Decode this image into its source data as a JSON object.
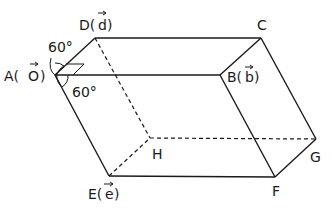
{
  "diagram": {
    "type": "parallelepiped",
    "vertices": {
      "A": {
        "label": "A(O)",
        "vector": "O",
        "x": 55,
        "y": 75
      },
      "B": {
        "label": "B(b)",
        "vector": "b",
        "x": 220,
        "y": 75
      },
      "C": {
        "label": "C",
        "x": 261,
        "y": 38
      },
      "D": {
        "label": "D(d)",
        "vector": "d",
        "x": 95,
        "y": 38
      },
      "E": {
        "label": "E(e)",
        "vector": "e",
        "x": 109,
        "y": 176
      },
      "F": {
        "label": "F",
        "x": 275,
        "y": 177
      },
      "G": {
        "label": "G",
        "x": 316,
        "y": 139
      },
      "H": {
        "label": "H",
        "x": 150,
        "y": 138
      }
    },
    "labels": {
      "A_letter": "A(",
      "A_vec": "O",
      "A_close": ")",
      "B_letter": "B(",
      "B_vec": "b",
      "B_close": ")",
      "C": "C",
      "D_letter": "D(",
      "D_vec": "d",
      "D_close": ")",
      "E_letter": "E(",
      "E_vec": "e",
      "E_close": ")",
      "F": "F",
      "G": "G",
      "H": "H"
    },
    "angles": {
      "DAB": "60°",
      "BAE": "60°"
    },
    "solid_edges": [
      "AB",
      "BC",
      "CD",
      "DA",
      "AE",
      "EF",
      "FG",
      "BF",
      "CG"
    ],
    "hidden_edges": [
      "DH",
      "EH",
      "HG"
    ],
    "colors": {
      "line": "#1a1a1a",
      "angle_fill": "#a0a0a0",
      "background": "#ffffff"
    }
  }
}
